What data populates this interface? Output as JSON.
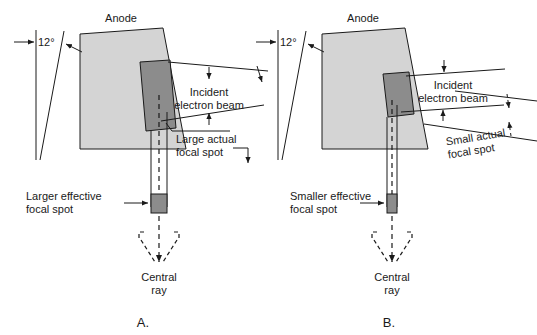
{
  "figure": {
    "title_anode": "Anode",
    "panels": [
      {
        "id": "A",
        "panel_label": "A.",
        "anode_label": "Anode",
        "angle_label": "12°",
        "incident_beam_label_line1": "Incident",
        "incident_beam_label_line2": "electron beam",
        "actual_focal_spot_line1": "Large actual",
        "actual_focal_spot_line2": "focal spot",
        "effective_focal_spot_line1": "Larger effective",
        "effective_focal_spot_line2": "focal spot",
        "central_ray_line1": "Central",
        "central_ray_line2": "ray"
      },
      {
        "id": "B",
        "panel_label": "B.",
        "anode_label": "Anode",
        "angle_label": "12°",
        "incident_beam_label_line1": "Incident",
        "incident_beam_label_line2": "electron beam",
        "actual_focal_spot_line1": "Small actual",
        "actual_focal_spot_line2": "focal spot",
        "effective_focal_spot_line1": "Smaller effective",
        "effective_focal_spot_line2": "focal spot",
        "central_ray_line1": "Central",
        "central_ray_line2": "ray"
      }
    ],
    "colors": {
      "anode_fill": "#d4d4d4",
      "focal_spot_fill": "#8c8c8c",
      "stroke": "#1a1a1a",
      "background": "#ffffff"
    }
  }
}
